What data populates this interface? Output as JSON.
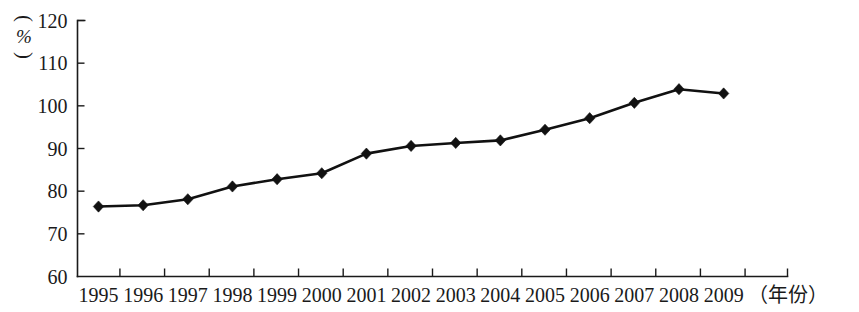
{
  "chart_data": {
    "type": "line",
    "title": "",
    "xlabel": "（年份）",
    "ylabel": "（%）",
    "categories": [
      "1995",
      "1996",
      "1997",
      "1998",
      "1999",
      "2000",
      "2001",
      "2002",
      "2003",
      "2004",
      "2005",
      "2006",
      "2007",
      "2008",
      "2009"
    ],
    "values": [
      76.4,
      76.7,
      78.1,
      81.1,
      82.8,
      84.2,
      88.8,
      90.6,
      91.3,
      91.9,
      94.4,
      97.1,
      100.7,
      103.9,
      102.9
    ],
    "ylim": [
      60,
      120
    ],
    "yticks": [
      60,
      70,
      80,
      90,
      100,
      110,
      120
    ],
    "ytick_labels": [
      "60",
      "70",
      "80",
      "90",
      "100",
      "110",
      "120"
    ],
    "grid": false,
    "legend": "none",
    "marker": "diamond",
    "line_color": "#111111",
    "marker_color": "#111111",
    "axis_color": "#1a1a1a",
    "background": "#ffffff"
  },
  "axes": {
    "unit_symbol": "%",
    "unit_paren_open": "(",
    "unit_paren_close": ")",
    "x_caption": "（年份）"
  }
}
